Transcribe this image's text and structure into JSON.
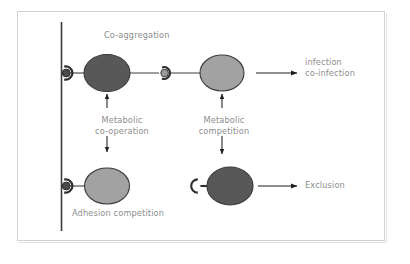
{
  "figure": {
    "title_label": "Co-aggregation",
    "labels": {
      "co_aggregation": "Co-aggregation",
      "metabolic_cooperation_line1": "Metabolic",
      "metabolic_cooperation_line2": "co-operation",
      "metabolic_competition_line1": "Metabolic",
      "metabolic_competition_line2": "competition",
      "adhesion_competition": "Adhesion competition",
      "infection_line1": "infection",
      "infection_line2": "co-infection",
      "exclusion": "Exclusion"
    },
    "colors": {
      "dark_cell": "#585858",
      "light_cell": "#a2a2a2",
      "cell_outline": "#3a3a3a",
      "surface_line": "#3c3c3c",
      "connector": "#3f3f3f",
      "arrow": "#1f1f1f",
      "text": "#8d8d8d",
      "frame_border": "#d2d2d2",
      "background": "#ffffff"
    },
    "elements": {
      "surface_line_name": "host-surface-line",
      "dark_cell_name": "dark-bacterium",
      "light_cell_name": "light-bacterium",
      "receptor_name": "receptor-adhesin-pair",
      "free_adhesin_name": "free-adhesin"
    },
    "outcomes": [
      "infection",
      "co-infection",
      "Exclusion"
    ],
    "interactions": [
      "Co-aggregation",
      "Metabolic co-operation",
      "Metabolic competition",
      "Adhesion competition"
    ]
  }
}
